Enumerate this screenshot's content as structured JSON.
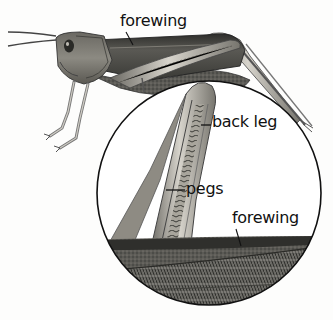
{
  "diagram": {
    "colors": {
      "background": "#fdfdfc",
      "outline": "#111111",
      "body_dark": "#4a4a44",
      "body_mid": "#7d7b72",
      "body_light": "#b9b6ad",
      "wing_dark": "#3c3c38"
    },
    "labels": [
      {
        "id": "forewing-top",
        "text": "forewing"
      },
      {
        "id": "back-leg",
        "text": "back leg"
      },
      {
        "id": "pegs",
        "text": "pegs"
      },
      {
        "id": "forewing-bottom",
        "text": "forewing"
      }
    ],
    "magnifier": {
      "shape": "circle",
      "cx": 209,
      "cy": 193,
      "r": 112
    }
  }
}
